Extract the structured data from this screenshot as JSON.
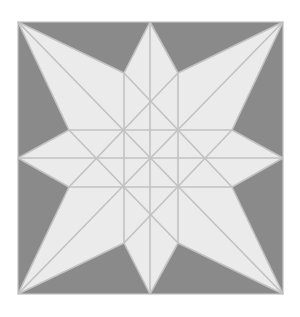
{
  "diagram": {
    "type": "eight-pointed-star-quilt-block",
    "colors": {
      "background": "#ffffff",
      "square_fill": "#8a8a8a",
      "star_fill": "#ebebeb",
      "line": "#c2c2c2"
    },
    "square": {
      "x": 18,
      "y": 22,
      "width": 265,
      "height": 272
    },
    "center": [
      150,
      158
    ],
    "outer_points": [
      [
        150,
        22
      ],
      [
        283,
        22
      ],
      [
        283,
        158
      ],
      [
        283,
        294
      ],
      [
        150,
        294
      ],
      [
        18,
        294
      ],
      [
        18,
        158
      ],
      [
        18,
        22
      ]
    ],
    "inner_points": [
      [
        178,
        73
      ],
      [
        232,
        130
      ],
      [
        232,
        187
      ],
      [
        178,
        243
      ],
      [
        124,
        243
      ],
      [
        69,
        187
      ],
      [
        69,
        130
      ],
      [
        124,
        73
      ]
    ]
  }
}
